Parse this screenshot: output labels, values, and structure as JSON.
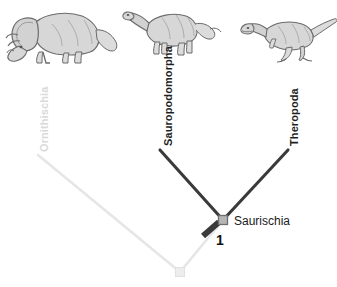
{
  "figure": {
    "kind": "cladogram",
    "width": 337,
    "height": 287,
    "background": "#ffffff"
  },
  "colors": {
    "active_branch": "#3a3a3a",
    "faded_branch": "#e6e6e6",
    "node_fill": "#b5b5b5",
    "node_stroke": "#6e6e6e",
    "faded_node_fill": "#ededed",
    "faded_node_stroke": "#e0e0e0",
    "hash_mark": "#3a3a3a",
    "label_dark": "#1f1f1f",
    "label_faded": "#d9d9d9",
    "dino_outline": "#6b6b6b",
    "dino_fill": "#d7d7d7"
  },
  "taxa": [
    {
      "id": "ornithischia",
      "label": "Ornithischia",
      "state": "faded",
      "orientation": "vertical",
      "label_x": 38,
      "label_y": 152,
      "tip_x": 38,
      "tip_y": 155
    },
    {
      "id": "sauropodomorpha",
      "label": "Sauropodomorpha",
      "state": "active",
      "orientation": "vertical",
      "label_x": 162,
      "label_y": 146,
      "tip_x": 160,
      "tip_y": 150
    },
    {
      "id": "theropoda",
      "label": "Theropoda",
      "state": "active",
      "orientation": "vertical",
      "label_x": 288,
      "label_y": 146,
      "tip_x": 288,
      "tip_y": 150
    }
  ],
  "nodes": [
    {
      "id": "saurischia",
      "label": "Saurischia",
      "state": "active",
      "x": 223,
      "y": 220,
      "label_x": 234,
      "label_y": 221
    },
    {
      "id": "dinosauria-root",
      "label": "",
      "state": "faded",
      "x": 180,
      "y": 272,
      "label_x": 0,
      "label_y": 0
    }
  ],
  "branches": [
    {
      "id": "root-to-ornithischia",
      "state": "faded",
      "x1": 180,
      "y1": 272,
      "x2": 38,
      "y2": 155
    },
    {
      "id": "root-to-saurischia",
      "state": "faded",
      "x1": 180,
      "y1": 272,
      "x2": 223,
      "y2": 220
    },
    {
      "id": "saurischia-to-sauropodomorpha",
      "state": "active",
      "x1": 223,
      "y1": 220,
      "x2": 160,
      "y2": 150
    },
    {
      "id": "saurischia-to-theropoda",
      "state": "active",
      "x1": 223,
      "y1": 220,
      "x2": 288,
      "y2": 150
    }
  ],
  "annotations": {
    "hash_mark": {
      "id": "synapomorphy-mark-1",
      "number": "1",
      "x": 211,
      "y": 229,
      "number_x": 216,
      "number_y": 234
    }
  },
  "illustrations": [
    {
      "id": "ceratopsian-illustration",
      "name": "ceratopsian-dinosaur",
      "for_taxon": "ornithischia",
      "x": 6,
      "y": 6,
      "width": 96,
      "height": 58
    },
    {
      "id": "sauropodomorph-illustration",
      "name": "sauropodomorph-dinosaur",
      "for_taxon": "sauropodomorpha",
      "x": 122,
      "y": 2,
      "width": 92,
      "height": 52
    },
    {
      "id": "theropod-illustration",
      "name": "theropod-dinosaur",
      "for_taxon": "theropoda",
      "x": 240,
      "y": 6,
      "width": 94,
      "height": 54
    }
  ]
}
